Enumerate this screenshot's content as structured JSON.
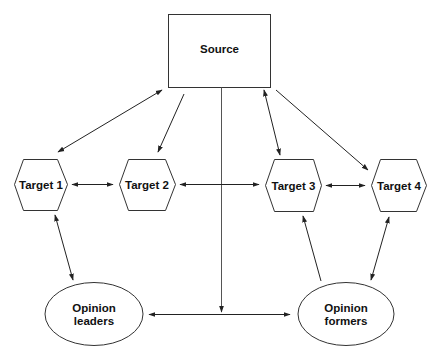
{
  "diagram": {
    "nodes": {
      "source": {
        "label": "Source",
        "shape": "rectangle"
      },
      "target1": {
        "label": "Target 1",
        "shape": "hexagon"
      },
      "target2": {
        "label": "Target 2",
        "shape": "hexagon"
      },
      "target3": {
        "label": "Target 3",
        "shape": "hexagon"
      },
      "target4": {
        "label": "Target 4",
        "shape": "hexagon"
      },
      "opinion_leaders": {
        "label_line1": "Opinion",
        "label_line2": "leaders",
        "shape": "ellipse"
      },
      "opinion_formers": {
        "label_line1": "Opinion",
        "label_line2": "formers",
        "shape": "ellipse"
      }
    },
    "edges": [
      {
        "from": "source",
        "to": "target1",
        "direction": "both"
      },
      {
        "from": "source",
        "to": "target2",
        "direction": "forward"
      },
      {
        "from": "source",
        "to": "target3",
        "direction": "both"
      },
      {
        "from": "source",
        "to": "target4",
        "direction": "forward"
      },
      {
        "from": "source",
        "to": "opinion_leaders_formers_link",
        "direction": "forward"
      },
      {
        "from": "target1",
        "to": "target2",
        "direction": "both"
      },
      {
        "from": "target2",
        "to": "target3",
        "direction": "both"
      },
      {
        "from": "target3",
        "to": "target4",
        "direction": "both"
      },
      {
        "from": "target1",
        "to": "opinion_leaders",
        "direction": "both"
      },
      {
        "from": "opinion_formers",
        "to": "target3",
        "direction": "forward"
      },
      {
        "from": "target4",
        "to": "opinion_formers",
        "direction": "both"
      },
      {
        "from": "opinion_leaders",
        "to": "opinion_formers",
        "direction": "both"
      }
    ],
    "colors": {
      "stroke": "#333333",
      "text": "#111111",
      "background": "#ffffff"
    }
  }
}
